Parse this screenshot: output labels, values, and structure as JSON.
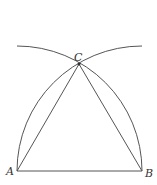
{
  "diagram": {
    "points": {
      "A": {
        "label": "A",
        "x": 17,
        "y": 171
      },
      "B": {
        "label": "B",
        "x": 142,
        "y": 171
      },
      "C": {
        "label": "C",
        "x": 79,
        "y": 64
      }
    },
    "segments": [
      {
        "from": "A",
        "to": "B"
      },
      {
        "from": "A",
        "to": "C"
      },
      {
        "from": "B",
        "to": "C"
      }
    ],
    "arcs": [
      {
        "center": "A",
        "radius": 125,
        "from": "B",
        "to_end": [
          17,
          46
        ],
        "passes_through": "C"
      },
      {
        "center": "B",
        "radius": 125,
        "from": "A",
        "to_end": [
          142,
          46
        ],
        "passes_through": "C"
      }
    ],
    "colors": {
      "stroke": "#555555",
      "label": "#333333",
      "background": "#ffffff"
    }
  }
}
